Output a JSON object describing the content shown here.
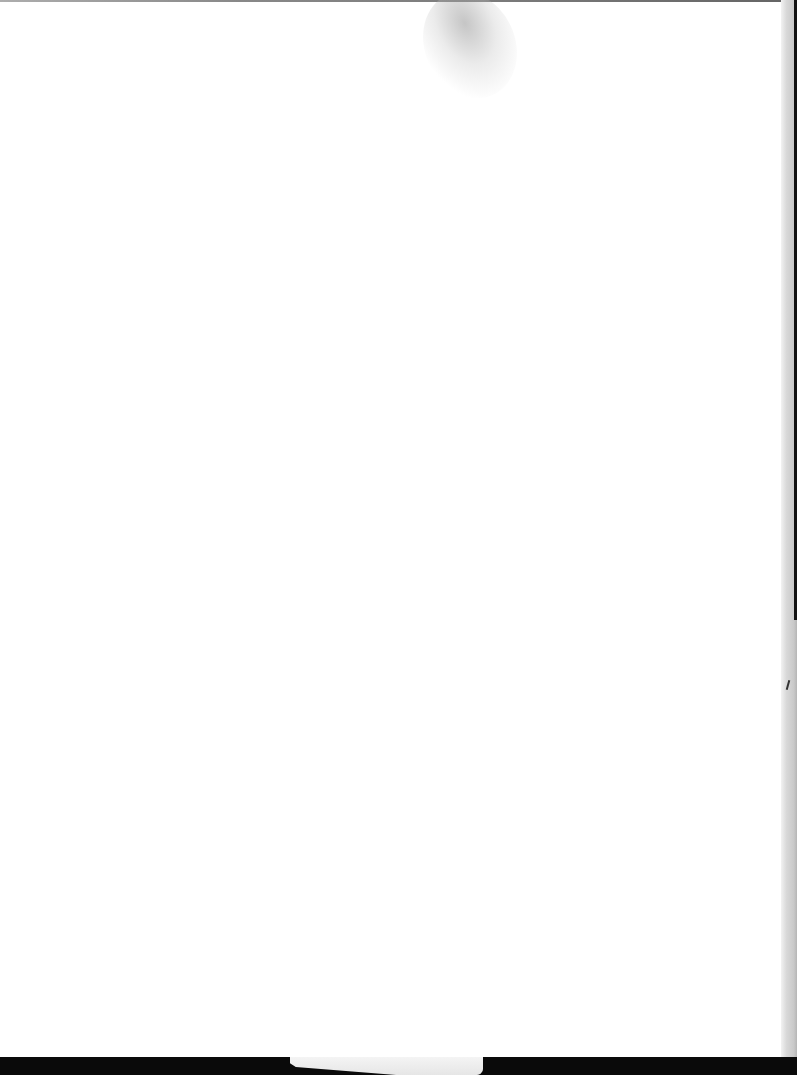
{
  "document": {
    "type": "blank scanned page",
    "text_content": "",
    "background_color": "#ffffff",
    "artifacts": {
      "top_edge_color": "#444444",
      "right_shadow_color": "#c9c9c9",
      "bottom_bar_color": "#0a0a0a",
      "paper_tab_color": "#eeeeee"
    }
  }
}
